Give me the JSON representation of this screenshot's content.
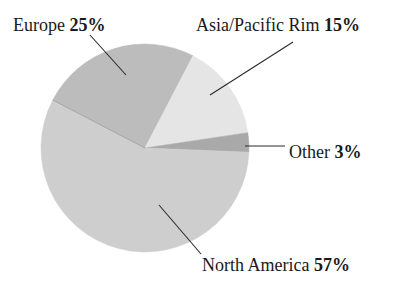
{
  "chart_data": {
    "type": "pie",
    "title": "",
    "center": [
      145,
      148
    ],
    "radius": 104,
    "start_angle_deg": -152.5,
    "slices": [
      {
        "name": "Europe",
        "value": 25,
        "label": "Europe",
        "pct": "25%",
        "color": "#bcbcbc"
      },
      {
        "name": "Asia/Pacific Rim",
        "value": 15,
        "label": "Asia/Pacific Rim",
        "pct": "15%",
        "color": "#e5e5e5"
      },
      {
        "name": "Other",
        "value": 3,
        "label": "Other",
        "pct": "3%",
        "color": "#a9a9a9"
      },
      {
        "name": "North America",
        "value": 57,
        "label": "North America",
        "pct": "57%",
        "color": "#cecece"
      }
    ],
    "labels": [
      {
        "slice": 0,
        "text_x": 13,
        "text_y": 31,
        "line": [
          [
            90,
            35
          ],
          [
            126,
            75
          ]
        ]
      },
      {
        "slice": 1,
        "text_x": 196,
        "text_y": 31,
        "line": [
          [
            293,
            42
          ],
          [
            210,
            95
          ]
        ]
      },
      {
        "slice": 2,
        "text_x": 289,
        "text_y": 158,
        "line": [
          [
            245,
            146
          ],
          [
            285,
            146
          ]
        ]
      },
      {
        "slice": 3,
        "text_x": 202,
        "text_y": 271,
        "line": [
          [
            159,
            205
          ],
          [
            201,
            254
          ]
        ]
      }
    ],
    "legend": "none",
    "grid": false
  }
}
